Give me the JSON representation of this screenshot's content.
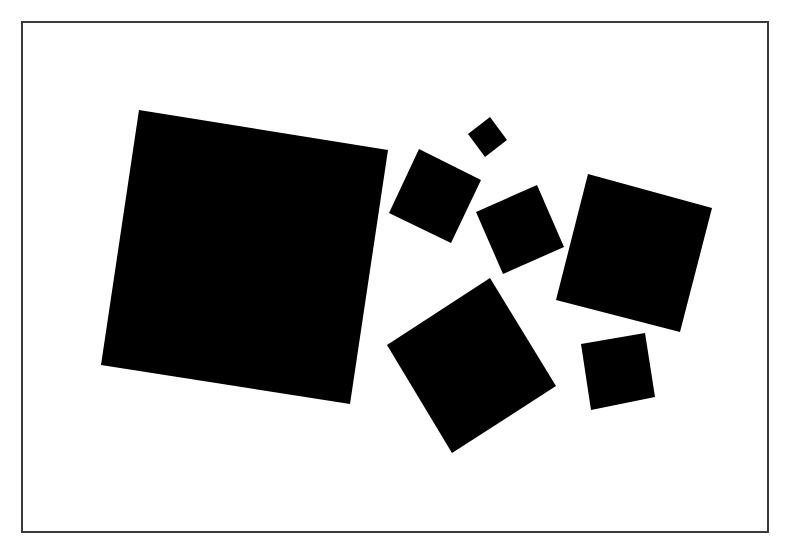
{
  "figure": {
    "background_color": "#ffffff",
    "frame_color": "#3a3a3a",
    "square_color": "#000000",
    "square_count": 7,
    "squares": [
      {
        "name": "large-square",
        "relative_size": "largest",
        "rotation_deg": 9
      },
      {
        "name": "tiny-square",
        "relative_size": "smallest",
        "rotation_deg": 53
      },
      {
        "name": "upper-middle-square",
        "relative_size": "small",
        "rotation_deg": 27
      },
      {
        "name": "center-square",
        "relative_size": "small",
        "rotation_deg": -24
      },
      {
        "name": "right-square",
        "relative_size": "medium",
        "rotation_deg": 15
      },
      {
        "name": "lower-middle-square",
        "relative_size": "medium",
        "rotation_deg": -33
      },
      {
        "name": "lower-right-square",
        "relative_size": "small",
        "rotation_deg": -10
      }
    ]
  }
}
